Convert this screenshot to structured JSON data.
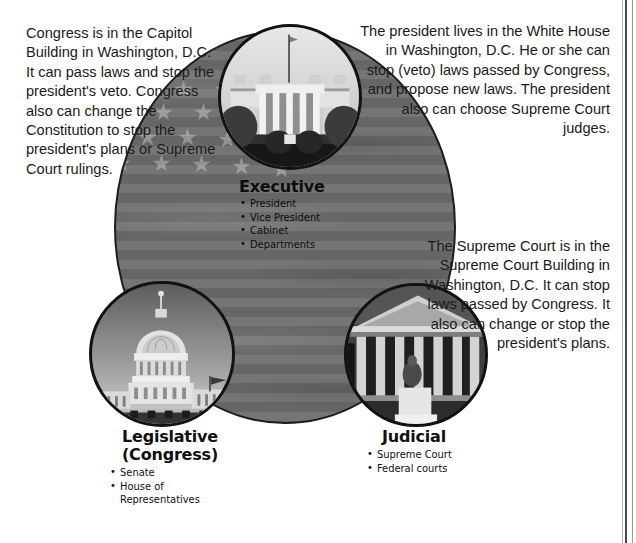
{
  "diagram": {
    "background_color": "#ffffff",
    "oval_color": "#6d6d6d",
    "text_color": "#1a1a1a",
    "outline_color": "#121212"
  },
  "prose": {
    "congress": "Congress is in the Capitol Building in Washington, D.C. It can pass laws and stop the president's veto. Congress also can change the Constitution to stop the president's plans or Supreme Court rulings.",
    "president": "The president lives in the White House in Washington, D.C.  He or she can stop (veto) laws passed by Congress, and propose new laws. The president also can choose Supreme Court judges.",
    "supreme": "The Supreme Court is in the Supreme Court Building in Washington, D.C. It can stop laws passed by Congress.  It also can change or stop the president's plans."
  },
  "branches": [
    {
      "id": "executive",
      "title": "Executive",
      "photo": "white-house-photo",
      "members": [
        "President",
        "Vice President",
        "Cabinet",
        "Departments"
      ]
    },
    {
      "id": "legislative",
      "title_line1": "Legislative",
      "title_line2": "(Congress)",
      "photo": "capitol-building-photo",
      "members": [
        "Senate",
        "House of\nRepresentatives"
      ]
    },
    {
      "id": "judicial",
      "title": "Judicial",
      "photo": "supreme-court-photo",
      "members": [
        "Supreme Court",
        "Federal courts"
      ]
    }
  ]
}
